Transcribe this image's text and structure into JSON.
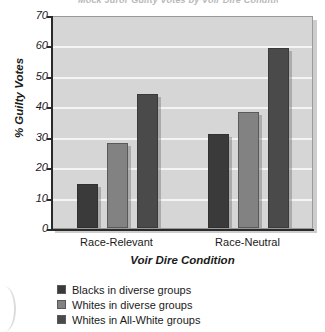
{
  "chart_data": {
    "type": "bar",
    "title": "Mock Juror Guilty Votes by Voir Dire Condition",
    "xlabel": "Voir Dire Condition",
    "ylabel": "% Guilty Votes",
    "categories": [
      "Race-Relevant",
      "Race-Neutral"
    ],
    "series": [
      {
        "name": "Blacks in diverse groups",
        "color": "#3a3a3a",
        "values": [
          14.5,
          31
        ]
      },
      {
        "name": "Whites in diverse groups",
        "color": "#828282",
        "values": [
          28,
          38
        ]
      },
      {
        "name": "Whites in All-White groups",
        "color": "#4a4a4a",
        "values": [
          44,
          59
        ]
      }
    ],
    "ylim": [
      0,
      70
    ],
    "ytick_step": 10,
    "yticks": [
      "70",
      "60",
      "50",
      "40",
      "30",
      "20",
      "10",
      "0"
    ],
    "grid": true,
    "legend_position": "bottom-left",
    "plot_background": "#d6d6d6",
    "gridline_color": "#f4f4f4"
  }
}
